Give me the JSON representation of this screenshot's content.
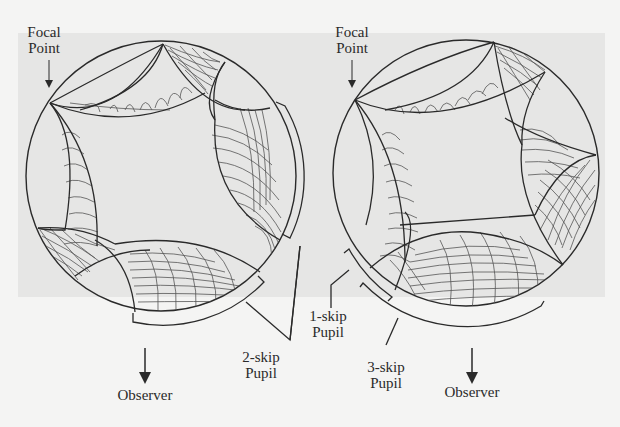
{
  "figure": {
    "left_panel": {
      "focal_point_label": [
        "Focal",
        "Point"
      ],
      "pupil_label": [
        "2-skip",
        "Pupil"
      ],
      "observer_label": "Observer"
    },
    "right_panel": {
      "focal_point_label": [
        "Focal",
        "Point"
      ],
      "pupil_label_1": [
        "1-skip",
        "Pupil"
      ],
      "pupil_label_3": [
        "3-skip",
        "Pupil"
      ],
      "observer_label": "Observer"
    }
  },
  "colors": {
    "page_background": "#f4f4f3",
    "panel_background": "#e6e6e5",
    "line": "#2a2a2a",
    "hatch": "#555555"
  }
}
